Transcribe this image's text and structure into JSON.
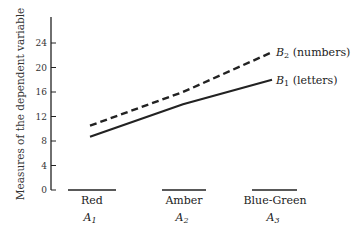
{
  "chart_data": {
    "type": "line",
    "title": "",
    "xlabel": "",
    "ylabel": "Measures of the dependent variable",
    "ylim": [
      0,
      28
    ],
    "yticks": [
      0,
      4,
      8,
      12,
      16,
      20,
      24
    ],
    "categories": [
      "Red",
      "Amber",
      "Blue-Green"
    ],
    "category_subscripts": [
      "A1",
      "A2",
      "A3"
    ],
    "grid": false,
    "series": [
      {
        "name": "B2 (numbers)",
        "label_base": "B",
        "label_sub": "2",
        "label_rest": " (numbers)",
        "style": "dashed",
        "values": [
          10.5,
          16,
          22.5
        ]
      },
      {
        "name": "B1 (letters)",
        "label_base": "B",
        "label_sub": "1",
        "label_rest": " (letters)",
        "style": "solid",
        "values": [
          8.7,
          14,
          18
        ]
      }
    ]
  },
  "axis": {
    "ylabel": "Measures of the dependent variable",
    "ticks": [
      "0",
      "4",
      "8",
      "12",
      "16",
      "20",
      "24"
    ]
  },
  "xcats": [
    {
      "name": "Red",
      "sub_base": "A",
      "sub": "1"
    },
    {
      "name": "Amber",
      "sub_base": "A",
      "sub": "2"
    },
    {
      "name": "Blue-Green",
      "sub_base": "A",
      "sub": "3"
    }
  ],
  "legend": {
    "b2": {
      "base": "B",
      "sub": "2",
      "rest": " (numbers)"
    },
    "b1": {
      "base": "B",
      "sub": "1",
      "rest": " (letters)"
    }
  }
}
